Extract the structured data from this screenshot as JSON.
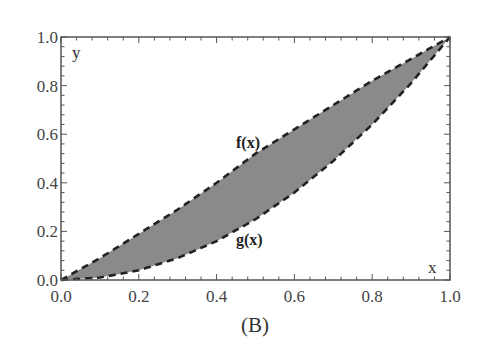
{
  "chart_data": {
    "type": "area",
    "title": "",
    "caption": "(B)",
    "xlabel": "x",
    "ylabel": "y",
    "xlim": [
      0,
      1
    ],
    "ylim": [
      0,
      1
    ],
    "grid": false,
    "x_ticks": [
      "0.0",
      "0.2",
      "0.4",
      "0.6",
      "0.8",
      "1.0"
    ],
    "y_ticks": [
      "0.0",
      "0.2",
      "0.4",
      "0.6",
      "0.8",
      "1.0"
    ],
    "x": [
      0.0,
      0.1,
      0.2,
      0.3,
      0.4,
      0.5,
      0.6,
      0.7,
      0.8,
      0.9,
      1.0
    ],
    "series": [
      {
        "name": "f(x)",
        "style": "dashed",
        "values": [
          0.0,
          0.09,
          0.19,
          0.29,
          0.4,
          0.52,
          0.62,
          0.72,
          0.82,
          0.91,
          1.0
        ]
      },
      {
        "name": "g(x)",
        "style": "dashed",
        "values": [
          0.0,
          0.01,
          0.04,
          0.09,
          0.16,
          0.25,
          0.36,
          0.49,
          0.64,
          0.81,
          1.0
        ]
      }
    ],
    "fill_between": {
      "upper": "f(x)",
      "lower": "g(x)",
      "color": "#8a8a8a"
    },
    "annotations": [
      {
        "text": "f(x)",
        "x": 0.47,
        "y": 0.57
      },
      {
        "text": "g(x)",
        "x": 0.47,
        "y": 0.17
      }
    ]
  },
  "labels": {
    "x_axis": "x",
    "y_axis": "y",
    "f_label": "f(x)",
    "g_label": "g(x)",
    "caption": "(B)"
  },
  "colors": {
    "fill": "#8a8a8a",
    "curve": "#222222",
    "frame": "#555555"
  }
}
